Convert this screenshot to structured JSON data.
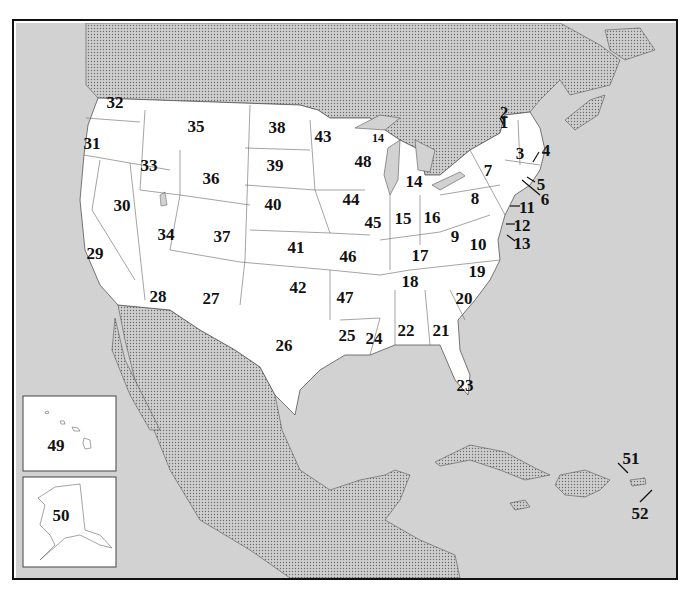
{
  "map": {
    "title": "",
    "colors": {
      "land_us": "#ffffff",
      "foreign_land": "#c8c8c8",
      "water": "#d4d4d4",
      "border": "#555555",
      "frame": "#111111"
    },
    "labels": [
      {
        "id": "1",
        "text": "1",
        "x": 504,
        "y": 122
      },
      {
        "id": "2",
        "text": "2",
        "x": 504,
        "y": 112
      },
      {
        "id": "3",
        "text": "3",
        "x": 520,
        "y": 153
      },
      {
        "id": "4",
        "text": "4",
        "x": 546,
        "y": 150
      },
      {
        "id": "5",
        "text": "5",
        "x": 541,
        "y": 184
      },
      {
        "id": "6",
        "text": "6",
        "x": 545,
        "y": 199
      },
      {
        "id": "7",
        "text": "7",
        "x": 488,
        "y": 170
      },
      {
        "id": "8",
        "text": "8",
        "x": 475,
        "y": 198
      },
      {
        "id": "9",
        "text": "9",
        "x": 455,
        "y": 236
      },
      {
        "id": "10",
        "text": "10",
        "x": 478,
        "y": 244
      },
      {
        "id": "11",
        "text": "11",
        "x": 527,
        "y": 207
      },
      {
        "id": "12",
        "text": "12",
        "x": 522,
        "y": 225
      },
      {
        "id": "13",
        "text": "13",
        "x": 522,
        "y": 243
      },
      {
        "id": "14",
        "text": "14",
        "x": 414,
        "y": 181
      },
      {
        "id": "14b",
        "text": "14",
        "x": 378,
        "y": 138
      },
      {
        "id": "15",
        "text": "15",
        "x": 403,
        "y": 218
      },
      {
        "id": "16",
        "text": "16",
        "x": 432,
        "y": 217
      },
      {
        "id": "17",
        "text": "17",
        "x": 420,
        "y": 255
      },
      {
        "id": "18",
        "text": "18",
        "x": 410,
        "y": 281
      },
      {
        "id": "19",
        "text": "19",
        "x": 477,
        "y": 271
      },
      {
        "id": "20",
        "text": "20",
        "x": 464,
        "y": 298
      },
      {
        "id": "21",
        "text": "21",
        "x": 441,
        "y": 330
      },
      {
        "id": "22",
        "text": "22",
        "x": 406,
        "y": 330
      },
      {
        "id": "23",
        "text": "23",
        "x": 465,
        "y": 385
      },
      {
        "id": "24",
        "text": "24",
        "x": 374,
        "y": 338
      },
      {
        "id": "25",
        "text": "25",
        "x": 347,
        "y": 335
      },
      {
        "id": "26",
        "text": "26",
        "x": 284,
        "y": 345
      },
      {
        "id": "27",
        "text": "27",
        "x": 211,
        "y": 298
      },
      {
        "id": "28",
        "text": "28",
        "x": 158,
        "y": 296
      },
      {
        "id": "29",
        "text": "29",
        "x": 95,
        "y": 253
      },
      {
        "id": "30",
        "text": "30",
        "x": 122,
        "y": 205
      },
      {
        "id": "31",
        "text": "31",
        "x": 92,
        "y": 143
      },
      {
        "id": "32",
        "text": "32",
        "x": 115,
        "y": 102
      },
      {
        "id": "33",
        "text": "33",
        "x": 149,
        "y": 165
      },
      {
        "id": "34",
        "text": "34",
        "x": 166,
        "y": 234
      },
      {
        "id": "35",
        "text": "35",
        "x": 196,
        "y": 126
      },
      {
        "id": "36",
        "text": "36",
        "x": 211,
        "y": 178
      },
      {
        "id": "37",
        "text": "37",
        "x": 222,
        "y": 236
      },
      {
        "id": "38",
        "text": "38",
        "x": 277,
        "y": 127
      },
      {
        "id": "39",
        "text": "39",
        "x": 275,
        "y": 165
      },
      {
        "id": "40",
        "text": "40",
        "x": 273,
        "y": 204
      },
      {
        "id": "41",
        "text": "41",
        "x": 296,
        "y": 247
      },
      {
        "id": "42",
        "text": "42",
        "x": 298,
        "y": 287
      },
      {
        "id": "43",
        "text": "43",
        "x": 323,
        "y": 136
      },
      {
        "id": "44",
        "text": "44",
        "x": 351,
        "y": 199
      },
      {
        "id": "45",
        "text": "45",
        "x": 373,
        "y": 222
      },
      {
        "id": "46",
        "text": "46",
        "x": 348,
        "y": 256
      },
      {
        "id": "47",
        "text": "47",
        "x": 345,
        "y": 297
      },
      {
        "id": "48",
        "text": "48",
        "x": 363,
        "y": 161
      },
      {
        "id": "49",
        "text": "49",
        "x": 56,
        "y": 445
      },
      {
        "id": "50",
        "text": "50",
        "x": 61,
        "y": 515
      },
      {
        "id": "51",
        "text": "51",
        "x": 631,
        "y": 458
      },
      {
        "id": "52",
        "text": "52",
        "x": 640,
        "y": 513
      }
    ],
    "insets": [
      {
        "name": "hawaii",
        "label": "49"
      },
      {
        "name": "alaska",
        "label": "50"
      }
    ]
  }
}
